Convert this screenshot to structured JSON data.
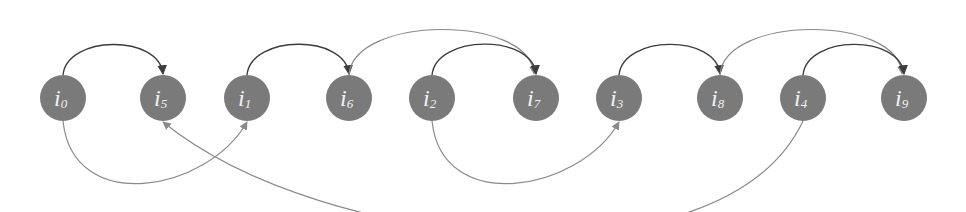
{
  "diagram": {
    "nodes": [
      {
        "id": "i0",
        "base": "i",
        "sub": "0"
      },
      {
        "id": "i5",
        "base": "i",
        "sub": "5"
      },
      {
        "id": "i1",
        "base": "i",
        "sub": "1"
      },
      {
        "id": "i6",
        "base": "i",
        "sub": "6"
      },
      {
        "id": "i2",
        "base": "i",
        "sub": "2"
      },
      {
        "id": "i7",
        "base": "i",
        "sub": "7"
      },
      {
        "id": "i3",
        "base": "i",
        "sub": "3"
      },
      {
        "id": "i8",
        "base": "i",
        "sub": "8"
      },
      {
        "id": "i4",
        "base": "i",
        "sub": "4"
      },
      {
        "id": "i9",
        "base": "i",
        "sub": "9"
      }
    ],
    "edges": [
      {
        "from": "i0",
        "to": "i5",
        "side": "top",
        "style": "dark"
      },
      {
        "from": "i1",
        "to": "i6",
        "side": "top",
        "style": "dark"
      },
      {
        "from": "i6",
        "to": "i7",
        "side": "top",
        "style": "light"
      },
      {
        "from": "i2",
        "to": "i7",
        "side": "top",
        "style": "dark"
      },
      {
        "from": "i3",
        "to": "i8",
        "side": "top",
        "style": "dark"
      },
      {
        "from": "i8",
        "to": "i9",
        "side": "top",
        "style": "light"
      },
      {
        "from": "i4",
        "to": "i9",
        "side": "top",
        "style": "dark"
      },
      {
        "from": "i0",
        "to": "i1",
        "side": "bottom",
        "style": "light"
      },
      {
        "from": "i2",
        "to": "i3",
        "side": "bottom",
        "style": "light"
      },
      {
        "from": "i4",
        "to": "i5",
        "side": "bottom",
        "style": "light"
      }
    ],
    "colors": {
      "node_fill": "#7a7a7a",
      "label": "#f2f2f2",
      "edge_dark": "#3c3c3c",
      "edge_light": "#8a8a8a"
    }
  }
}
